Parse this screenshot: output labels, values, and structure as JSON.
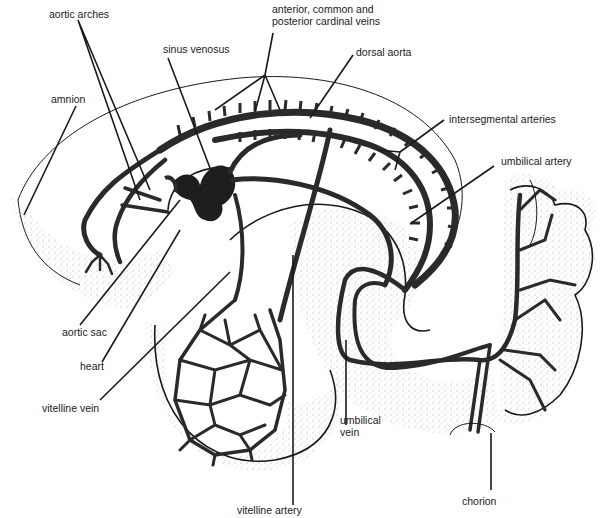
{
  "diagram": {
    "colors": {
      "ink": "#1a1a1a",
      "vessel": "#2a2a2a",
      "stipple": "#9a9a9a",
      "background": "#ffffff"
    },
    "labels": {
      "aortic_arches": "aortic arches",
      "cardinal_veins": "anterior, common and\nposterior cardinal veins",
      "sinus_venosus": "sinus venosus",
      "dorsal_aorta": "dorsal aorta",
      "amnion": "amnion",
      "intersegmental_arteries": "intersegmental arteries",
      "umbilical_artery": "umbilical artery",
      "aortic_sac": "aortic sac",
      "heart": "heart",
      "vitelline_vein": "vitelline vein",
      "umbilical_vein": "umbilical\nvein",
      "vitelline_artery": "vitelline artery",
      "chorion": "chorion"
    }
  }
}
